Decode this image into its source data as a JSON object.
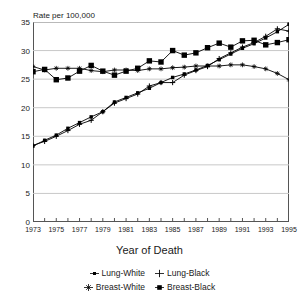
{
  "chart_data": {
    "type": "line",
    "title": "",
    "ylabel": "Rate per 100,000",
    "xlabel": "Year of Death",
    "ylim": [
      0,
      35
    ],
    "yticks": [
      0,
      5,
      10,
      15,
      20,
      25,
      30,
      35
    ],
    "xlim": [
      1973,
      1995
    ],
    "xticks": [
      1973,
      1975,
      1977,
      1979,
      1981,
      1983,
      1985,
      1987,
      1989,
      1991,
      1993,
      1995
    ],
    "x": [
      1973,
      1974,
      1975,
      1976,
      1977,
      1978,
      1979,
      1980,
      1981,
      1982,
      1983,
      1984,
      1985,
      1986,
      1987,
      1988,
      1989,
      1990,
      1991,
      1992,
      1993,
      1994,
      1995
    ],
    "grid": "horizontal",
    "legend_position": "bottom",
    "series": [
      {
        "name": "Lung-White",
        "marker": "small-square",
        "values": [
          13.3,
          14.3,
          15.2,
          16.4,
          17.4,
          18.4,
          19.3,
          21.0,
          21.8,
          22.6,
          23.4,
          24.4,
          25.3,
          25.9,
          26.6,
          27.4,
          28.4,
          29.4,
          30.4,
          31.2,
          32.2,
          33.3,
          34.6
        ]
      },
      {
        "name": "Lung-Black",
        "marker": "plus",
        "values": [
          13.4,
          14.1,
          15.0,
          16.0,
          17.1,
          17.8,
          19.3,
          20.8,
          21.6,
          22.4,
          23.8,
          24.4,
          24.4,
          25.7,
          26.5,
          27.2,
          28.6,
          29.6,
          30.6,
          31.4,
          32.5,
          33.8,
          33.4
        ]
      },
      {
        "name": "Breast-White",
        "marker": "star",
        "values": [
          27.2,
          26.6,
          26.9,
          26.9,
          26.9,
          26.5,
          26.3,
          26.6,
          26.6,
          26.5,
          26.8,
          26.8,
          27.0,
          27.1,
          27.3,
          27.3,
          27.3,
          27.5,
          27.5,
          27.2,
          26.8,
          26.0,
          24.9
        ]
      },
      {
        "name": "Breast-Black",
        "marker": "big-square",
        "values": [
          26.3,
          26.7,
          24.9,
          25.2,
          26.4,
          27.4,
          26.4,
          25.7,
          26.4,
          26.9,
          28.2,
          28.0,
          30.0,
          29.2,
          29.6,
          30.5,
          31.3,
          30.6,
          31.7,
          31.8,
          31.0,
          31.4,
          31.9
        ]
      }
    ]
  },
  "legend": {
    "items": [
      {
        "label": "Lung-White"
      },
      {
        "label": "Lung-Black"
      },
      {
        "label": "Breast-White"
      },
      {
        "label": "Breast-Black"
      }
    ]
  },
  "colors": {
    "series": "#000000",
    "grid": "#c8c8c8",
    "axis": "#555555",
    "text": "#1a1a1a"
  }
}
